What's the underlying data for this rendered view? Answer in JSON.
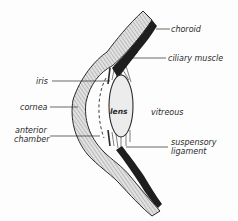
{
  "diagram": {
    "labels": {
      "choroid": "choroid",
      "ciliary_muscle": "ciliary muscle",
      "iris": "iris",
      "cornea": "cornea",
      "anterior_chamber_line1": "anterior",
      "anterior_chamber_line2": "chamber",
      "lens": "lens",
      "vitreous": "vitreous",
      "suspensory_ligament_line1": "suspensory",
      "suspensory_ligament_line2": "ligament"
    },
    "colors": {
      "outline": "#2a2a2a",
      "hatch_fill": "#d8d8d8",
      "choroid_fill": "#1e1e1e",
      "lens_fill": "#ececec",
      "background": "#fdfdfd"
    }
  }
}
